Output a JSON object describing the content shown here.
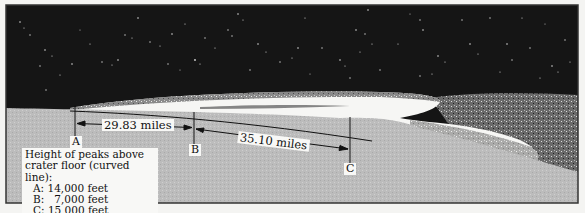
{
  "diagram": {
    "markers": [
      {
        "id": "A",
        "label": "A"
      },
      {
        "id": "B",
        "label": "B"
      },
      {
        "id": "C",
        "label": "C"
      }
    ],
    "distances": [
      {
        "from": "A",
        "to": "B",
        "label": "29.83 miles"
      },
      {
        "from": "B",
        "to": "C",
        "label": "35.10 miles"
      }
    ],
    "legend": {
      "title_line1": "Height of peaks above",
      "title_line2": "crater floor (curved line):",
      "rows": [
        {
          "marker": "A",
          "text": "A: 14,000 feet"
        },
        {
          "marker": "B",
          "text": "B:   7,000 feet"
        },
        {
          "marker": "C",
          "text": "C: 15,000 feet"
        }
      ]
    },
    "colors": {
      "sky": "#141414",
      "crater_floor": "#bdbdbd",
      "crater_rim_light": "#f7f7f5",
      "lines": "#111111"
    }
  }
}
